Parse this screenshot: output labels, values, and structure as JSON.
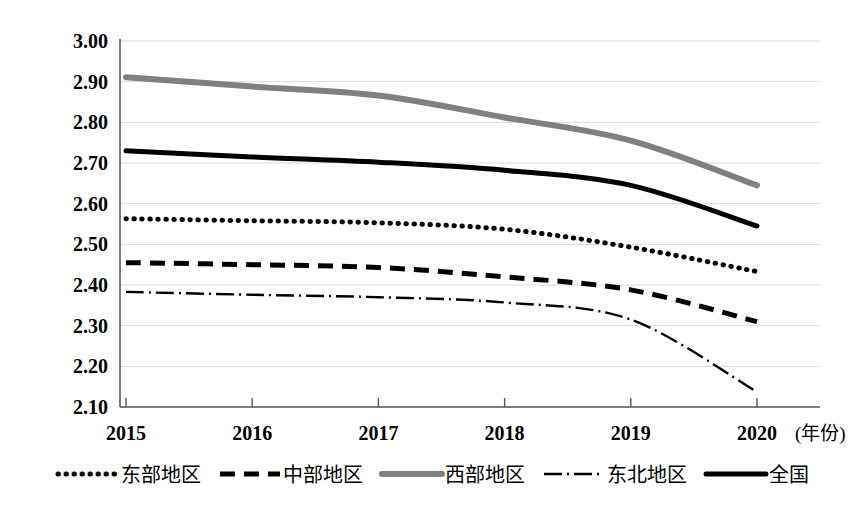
{
  "chart_data": {
    "type": "line",
    "title": "",
    "xlabel": "年份",
    "ylabel": "",
    "x": [
      2015,
      2016,
      2017,
      2018,
      2019,
      2020
    ],
    "xtick_labels": [
      "2015",
      "2016",
      "2017",
      "2018",
      "2019",
      "2020"
    ],
    "x_axis_unit_label": "(年份)",
    "ytick_labels": [
      "3.00",
      "2.90",
      "2.80",
      "2.70",
      "2.60",
      "2.50",
      "2.40",
      "2.30",
      "2.20",
      "2.10"
    ],
    "yticks": [
      3.0,
      2.9,
      2.8,
      2.7,
      2.6,
      2.5,
      2.4,
      2.3,
      2.2,
      2.1
    ],
    "ylim": [
      2.1,
      3.0
    ],
    "xlim": [
      2015,
      2020
    ],
    "grid": true,
    "legend_position": "bottom",
    "series": [
      {
        "name": "东部地区",
        "style": "dotted",
        "color": "#000000",
        "width": 5,
        "dasharray": "0.5,7.5",
        "linecap": "round",
        "values": [
          2.563,
          2.558,
          2.553,
          2.537,
          2.493,
          2.433
        ]
      },
      {
        "name": "中部地区",
        "style": "dashed",
        "color": "#000000",
        "width": 5,
        "dasharray": "15,9",
        "linecap": "butt",
        "values": [
          2.455,
          2.45,
          2.443,
          2.42,
          2.388,
          2.31
        ]
      },
      {
        "name": "西部地区",
        "style": "solid",
        "color": "#808080",
        "width": 6,
        "dasharray": "",
        "linecap": "round",
        "values": [
          2.911,
          2.888,
          2.866,
          2.812,
          2.755,
          2.645
        ]
      },
      {
        "name": "东北地区",
        "style": "dashdot",
        "color": "#000000",
        "width": 2.4,
        "dasharray": "18,5,2,5",
        "linecap": "butt",
        "values": [
          2.383,
          2.376,
          2.37,
          2.357,
          2.315,
          2.137
        ]
      },
      {
        "name": "全国",
        "style": "solid",
        "color": "#000000",
        "width": 5,
        "dasharray": "",
        "linecap": "round",
        "values": [
          2.73,
          2.715,
          2.702,
          2.682,
          2.645,
          2.545
        ]
      }
    ]
  },
  "legend": {
    "items": [
      {
        "label": "东部地区",
        "sample": "dotted"
      },
      {
        "label": "中部地区",
        "sample": "dashed"
      },
      {
        "label": "西部地区",
        "sample": "solid-gray"
      },
      {
        "label": "东北地区",
        "sample": "dashdot"
      },
      {
        "label": "全国",
        "sample": "solid-black"
      }
    ]
  }
}
